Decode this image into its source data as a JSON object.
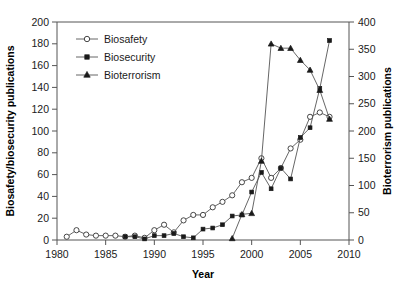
{
  "chart_data": {
    "type": "line",
    "title": "",
    "xlabel": "Year",
    "ylabel": "Biosafety/biosecurity publications",
    "y2label": "Bioterrorism publications",
    "xlim": [
      1980,
      2010
    ],
    "ylim": [
      0,
      200
    ],
    "y2lim": [
      0,
      400
    ],
    "xticks": [
      1980,
      1985,
      1990,
      1995,
      2000,
      2005,
      2010
    ],
    "yticks": [
      0,
      20,
      40,
      60,
      80,
      100,
      120,
      140,
      160,
      180,
      200
    ],
    "y2ticks": [
      0,
      50,
      100,
      150,
      200,
      250,
      300,
      350,
      400
    ],
    "xtick_labels": [
      "1980",
      "1985",
      "1990",
      "1995",
      "2000",
      "2005",
      "2010"
    ],
    "ytick_labels": [
      "0",
      "20",
      "40",
      "60",
      "80",
      "100",
      "120",
      "140",
      "160",
      "180",
      "200"
    ],
    "y2tick_labels": [
      "0",
      "50",
      "100",
      "150",
      "200",
      "250",
      "300",
      "350",
      "400"
    ],
    "grid": false,
    "legend_position": "top-left",
    "series": [
      {
        "name": "Biosafety",
        "axis": "left",
        "marker": "open-circle",
        "x": [
          1981,
          1982,
          1983,
          1984,
          1985,
          1986,
          1987,
          1988,
          1989,
          1990,
          1991,
          1992,
          1993,
          1994,
          1995,
          1996,
          1997,
          1998,
          1999,
          2000,
          2001,
          2002,
          2003,
          2004,
          2005,
          2006,
          2007,
          2008
        ],
        "values": [
          3,
          9,
          5,
          4,
          4,
          4,
          3,
          4,
          2,
          9,
          14,
          7,
          18,
          23,
          23,
          30,
          35,
          41,
          53,
          57,
          75,
          57,
          66,
          84,
          92,
          113,
          117,
          113
        ]
      },
      {
        "name": "Biosecurity",
        "axis": "left",
        "marker": "filled-square",
        "x": [
          1987,
          1988,
          1989,
          1990,
          1991,
          1992,
          1993,
          1994,
          1995,
          1996,
          1997,
          1998,
          1999,
          2000,
          2001,
          2002,
          2003,
          2004,
          2005,
          2006,
          2007,
          2008
        ],
        "values": [
          3,
          3,
          1,
          4,
          4,
          6,
          3,
          2,
          10,
          11,
          14,
          22,
          23,
          44,
          62,
          47,
          66,
          56,
          94,
          103,
          139,
          183
        ]
      },
      {
        "name": "Bioterrorism",
        "axis": "right",
        "marker": "filled-triangle",
        "x": [
          1998,
          1999,
          2000,
          2001,
          2002,
          2003,
          2004,
          2005,
          2006,
          2007,
          2008
        ],
        "values": [
          3,
          47,
          49,
          145,
          360,
          352,
          352,
          330,
          312,
          275,
          222
        ]
      }
    ]
  },
  "legend": {
    "items": [
      {
        "label": "Biosafety"
      },
      {
        "label": "Biosecurity"
      },
      {
        "label": "Bioterrorism"
      }
    ]
  },
  "colors": {
    "line": "#555555",
    "marker_fill": "#1a1a1a",
    "marker_open": "#ffffff",
    "text": "#1a1a1a",
    "background": "#ffffff"
  }
}
